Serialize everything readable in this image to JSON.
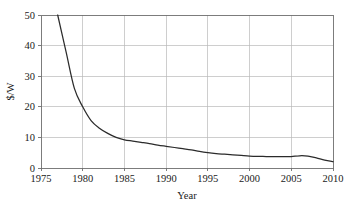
{
  "chart_data": {
    "type": "line",
    "title": "",
    "subtitle": "",
    "xlabel": "Year",
    "ylabel": "$/W",
    "xlim": [
      1975,
      2010
    ],
    "ylim": [
      0,
      50
    ],
    "grid": true,
    "legend": "none",
    "x_ticks": [
      "1975",
      "1980",
      "1985",
      "1990",
      "1995",
      "2000",
      "2005",
      "2010"
    ],
    "x_tick_values": [
      1975,
      1980,
      1985,
      1990,
      1995,
      2000,
      2005,
      2010
    ],
    "y_ticks": [
      "0",
      "10",
      "20",
      "30",
      "40",
      "50"
    ],
    "y_tick_values": [
      0,
      10,
      20,
      30,
      40,
      50
    ],
    "series": [
      {
        "name": "Module price",
        "color": "#2b2b2b",
        "x": [
          1977,
          1978,
          1979,
          1980,
          1981,
          1982,
          1983,
          1984,
          1985,
          1986,
          1987,
          1988,
          1989,
          1990,
          1991,
          1992,
          1993,
          1994,
          1995,
          1996,
          1997,
          1998,
          1999,
          2000,
          2001,
          2002,
          2003,
          2004,
          2005,
          2006,
          2007,
          2008,
          2009,
          2010
        ],
        "values": [
          50.0,
          38.0,
          26.0,
          20.0,
          15.5,
          13.0,
          11.3,
          10.0,
          9.2,
          8.8,
          8.4,
          8.0,
          7.5,
          7.1,
          6.7,
          6.3,
          5.9,
          5.4,
          5.0,
          4.7,
          4.5,
          4.3,
          4.1,
          3.9,
          3.8,
          3.75,
          3.7,
          3.7,
          3.75,
          4.0,
          3.9,
          3.3,
          2.6,
          2.1
        ]
      }
    ],
    "axis_colors": {
      "frame": "#6e6e6e",
      "gridline": "#b9b9b9",
      "line": "#2b2b2b",
      "text": "#1a1a1a",
      "background": "#ffffff"
    },
    "plot_area": {
      "left": 41,
      "top": 15,
      "right": 333,
      "bottom": 168
    }
  }
}
